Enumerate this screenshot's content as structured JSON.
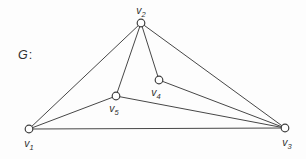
{
  "figure": {
    "name_label": "G",
    "name_separator": ":",
    "colors": {
      "edge_stroke": "#474747",
      "vertex_stroke": "#3f3f3f",
      "vertex_fill": "#ffffff",
      "label_text": "#2f2f2f",
      "background": "#fdfdfd"
    },
    "vertex_radius": 3.8,
    "edge_stroke_width": 1,
    "vertex_stroke_width": 1.2,
    "label_font_size": 10.5,
    "subscript_font_size": 7.5,
    "vertices": [
      {
        "id": "v1",
        "base": "v",
        "sub": "1",
        "x": 29,
        "y": 129,
        "label_x": 29,
        "label_y": 147
      },
      {
        "id": "v2",
        "base": "v",
        "sub": "2",
        "x": 141,
        "y": 23,
        "label_x": 141,
        "label_y": 14
      },
      {
        "id": "v3",
        "base": "v",
        "sub": "3",
        "x": 285,
        "y": 128,
        "label_x": 287,
        "label_y": 146
      },
      {
        "id": "v4",
        "base": "v",
        "sub": "4",
        "x": 159,
        "y": 80,
        "label_x": 156,
        "label_y": 96
      },
      {
        "id": "v5",
        "base": "v",
        "sub": "5",
        "x": 116,
        "y": 96,
        "label_x": 114,
        "label_y": 112
      }
    ],
    "edges": [
      [
        "v1",
        "v2"
      ],
      [
        "v1",
        "v5"
      ],
      [
        "v1",
        "v3"
      ],
      [
        "v2",
        "v5"
      ],
      [
        "v2",
        "v4"
      ],
      [
        "v2",
        "v3"
      ],
      [
        "v4",
        "v3"
      ],
      [
        "v5",
        "v3"
      ]
    ]
  }
}
